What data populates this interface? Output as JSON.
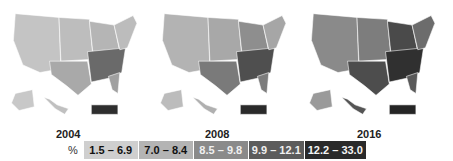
{
  "maps": [
    {
      "year": "2004",
      "fills": {
        "west": "#c4c4c4",
        "plains": "#bdbdbd",
        "texas": "#a9a9a9",
        "midwest": "#b5b5b5",
        "south": "#6a6a6a",
        "northeast": "#bcbcbc",
        "florida": "#a0a0a0",
        "alaska": "#c8c8c8",
        "hawaii": "#c0c0c0",
        "puerto_rico": "#2e2e2e"
      }
    },
    {
      "year": "2008",
      "fills": {
        "west": "#b3b3b3",
        "plains": "#a8a8a8",
        "texas": "#7a7a7a",
        "midwest": "#8e8e8e",
        "south": "#4f4f4f",
        "northeast": "#a6a6a6",
        "florida": "#7c7c7c",
        "alaska": "#bcbcbc",
        "hawaii": "#b0b0b0",
        "puerto_rico": "#2a2a2a"
      }
    },
    {
      "year": "2016",
      "fills": {
        "west": "#8a8a8a",
        "plains": "#7d7d7d",
        "texas": "#4d4d4d",
        "midwest": "#4a4a4a",
        "south": "#303030",
        "northeast": "#6c6c6c",
        "florida": "#5a5a5a",
        "alaska": "#9a9a9a",
        "hawaii": "#555555",
        "puerto_rico": "#252525"
      }
    }
  ],
  "legend": {
    "unit_label": "%",
    "bins": [
      {
        "label": "1.5 – 6.9",
        "color": "#cfcfcf",
        "text_color": "#111111"
      },
      {
        "label": "7.0 – 8.4",
        "color": "#b4b4b4",
        "text_color": "#111111"
      },
      {
        "label": "8.5 – 9.8",
        "color": "#8a8a8a",
        "text_color": "#f0f0f0"
      },
      {
        "label": "9.9 – 12.1",
        "color": "#5c5c5c",
        "text_color": "#f0f0f0"
      },
      {
        "label": "12.2 – 33.0",
        "color": "#2a2a2a",
        "text_color": "#f5f5f5"
      }
    ]
  }
}
